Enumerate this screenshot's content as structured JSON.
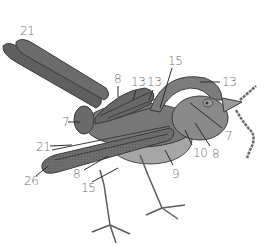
{
  "figure": {
    "colors": {
      "body_dark": "#5a5a5a",
      "body_mid": "#7a7a7a",
      "body_light": "#a6a6a6",
      "outline": "#3a3a3a",
      "label_text": "#707070",
      "leader_line": "#2a2a2a"
    },
    "labels": [
      {
        "id": "l1",
        "text": "21",
        "x": 20,
        "y": 25
      },
      {
        "id": "l2",
        "text": "8",
        "x": 114,
        "y": 73
      },
      {
        "id": "l3",
        "text": "13",
        "x": 131,
        "y": 76
      },
      {
        "id": "l4",
        "text": "13",
        "x": 147,
        "y": 76
      },
      {
        "id": "l5",
        "text": "15",
        "x": 168,
        "y": 55
      },
      {
        "id": "l6",
        "text": "13",
        "x": 222,
        "y": 76
      },
      {
        "id": "l7",
        "text": "7",
        "x": 62,
        "y": 116
      },
      {
        "id": "l8",
        "text": "7",
        "x": 225,
        "y": 130
      },
      {
        "id": "l9",
        "text": "10",
        "x": 193,
        "y": 147
      },
      {
        "id": "l10",
        "text": "8",
        "x": 212,
        "y": 148
      },
      {
        "id": "l11",
        "text": "9",
        "x": 172,
        "y": 168
      },
      {
        "id": "l12",
        "text": "21",
        "x": 36,
        "y": 141
      },
      {
        "id": "l13",
        "text": "26",
        "x": 24,
        "y": 175
      },
      {
        "id": "l14",
        "text": "8",
        "x": 73,
        "y": 168
      },
      {
        "id": "l15",
        "text": "15",
        "x": 81,
        "y": 182
      }
    ]
  }
}
